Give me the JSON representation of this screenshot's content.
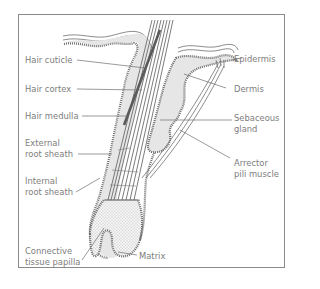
{
  "diagram": {
    "colors": {
      "frame": "#8a8a8a",
      "line": "#6e6e6e",
      "tissue_fill": "#e6e6e6",
      "label_text": "#7d7d7d",
      "leader_line": "#6e6e6e"
    },
    "labels_left": [
      {
        "id": "hair-cuticle",
        "text": "Hair cuticle"
      },
      {
        "id": "hair-cortex",
        "text": "Hair cortex"
      },
      {
        "id": "hair-medulla",
        "text": "Hair medulla"
      },
      {
        "id": "external-root-sheath",
        "line1": "External",
        "line2": "root sheath"
      },
      {
        "id": "internal-root-sheath",
        "line1": "Internal",
        "line2": "root sheath"
      },
      {
        "id": "connective-tissue-papilla",
        "line1": "Connective",
        "line2": "tissue papilla"
      }
    ],
    "labels_right": [
      {
        "id": "epidermis",
        "text": "Epidermis"
      },
      {
        "id": "dermis",
        "text": "Dermis"
      },
      {
        "id": "sebaceous-gland",
        "line1": "Sebaceous",
        "line2": "gland"
      },
      {
        "id": "arrector-pili-muscle",
        "line1": "Arrector",
        "line2": "pili muscle"
      },
      {
        "id": "matrix",
        "text": "Matrix"
      }
    ]
  }
}
